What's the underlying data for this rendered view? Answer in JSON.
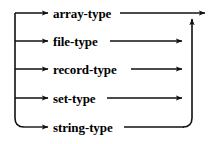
{
  "diagram": {
    "type": "railroad-syntax-diagram",
    "orientation": "vertical-alternatives",
    "stroke_color": "#111111",
    "background_color": "#ffffff",
    "entry": {
      "name": "entry-rail",
      "x": 15,
      "y_top": 13,
      "y_bottom": 127
    },
    "exit": {
      "name": "exit-rail",
      "x": 192,
      "y_top": 16,
      "y_bottom": 127,
      "exit_arrow_x": 207,
      "exit_arrow_y": 13
    },
    "branches": [
      {
        "id": "array-type",
        "label": "array-type",
        "row_y": 13,
        "label_x": 53,
        "label_width": 66,
        "arrow_in_x": 50,
        "line_out_to": 207,
        "terminates": "exit-arrow"
      },
      {
        "id": "file-type",
        "label": "file-type",
        "row_y": 41,
        "label_x": 53,
        "label_width": 55,
        "arrow_in_x": 50,
        "line_out_to": 184,
        "terminates": "right-rail"
      },
      {
        "id": "record-type",
        "label": "record-type",
        "row_y": 69,
        "label_x": 53,
        "label_width": 76,
        "arrow_in_x": 50,
        "line_out_to": 184,
        "terminates": "right-rail"
      },
      {
        "id": "set-type",
        "label": "set-type",
        "row_y": 98,
        "label_x": 53,
        "label_width": 52,
        "arrow_in_x": 50,
        "line_out_to": 184,
        "terminates": "right-rail"
      },
      {
        "id": "string-type",
        "label": "string-type",
        "row_y": 127,
        "label_x": 53,
        "label_width": 69,
        "arrow_in_x": 50,
        "line_out_to": 186,
        "terminates": "right-rail-corner"
      }
    ]
  }
}
